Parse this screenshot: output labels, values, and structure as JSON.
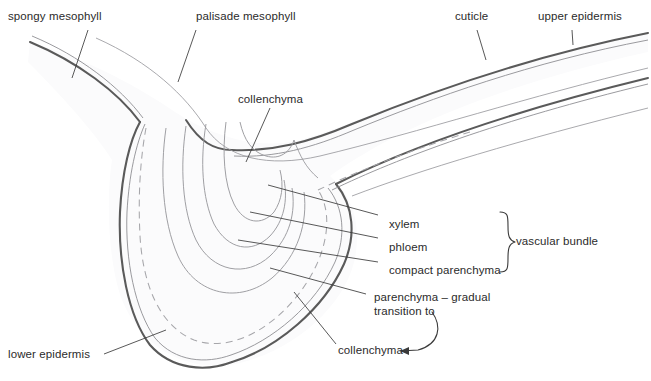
{
  "diagram": {
    "colors": {
      "cuticle": "#5a5a5a",
      "epidermis": "#8f8f93",
      "tissue_line": "#9a9a9e",
      "dashed_boundary": "#a6a6aa",
      "leader_line": "#3a3a3a",
      "text": "#2b2b2b",
      "background": "#ffffff",
      "fill_tint": "#fbfbfc"
    }
  },
  "labels": {
    "spongy_mesophyll": "spongy mesophyll",
    "palisade_mesophyll": "palisade mesophyll",
    "cuticle": "cuticle",
    "upper_epidermis": "upper epidermis",
    "collenchyma_top": "collenchyma",
    "xylem": "xylem",
    "phloem": "phloem",
    "compact_parenchyma": "compact parenchyma",
    "vascular_bundle": "vascular bundle",
    "parenchyma_line1": "parenchyma – gradual",
    "parenchyma_line2": "transition to",
    "collenchyma_bottom": "collenchyma",
    "lower_epidermis": "lower epidermis"
  }
}
